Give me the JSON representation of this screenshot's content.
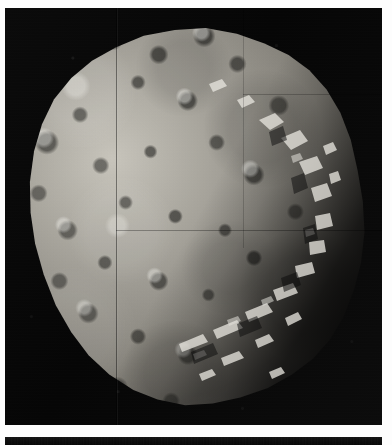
{
  "document": {
    "type": "photographic-plate",
    "media": "grayscale spacecraft photograph",
    "subject": "Phobos",
    "caption": "Phobos",
    "background_color": "#ffffff"
  },
  "plate": {
    "name": "phobos-photograph",
    "sky_color": "#070707",
    "surface_color": "#8a877f",
    "highlight_color": "#c9c6bd",
    "shadow_color": "#0a0a09",
    "alt_text": "Heavily cratered irregular moon lit from the upper left, with a deep shadowed terminator along the lower right limb, against a black starless sky",
    "features": [
      "cratered regolith surface",
      "bright sunlit limb on upper left",
      "deep terminator shadow lower right",
      "jagged illuminated ridges along terminator",
      "vertical mosaic seam line",
      "horizontal mosaic seam line"
    ]
  },
  "seams": {
    "vertical_label": "mosaic-seam-vertical",
    "horizontal_label": "mosaic-seam-horizontal"
  },
  "strip": {
    "name": "lower-plate-strip",
    "color": "#0b0b0b",
    "alt_text": "Top edge of a second dark photographic plate below the main image"
  }
}
